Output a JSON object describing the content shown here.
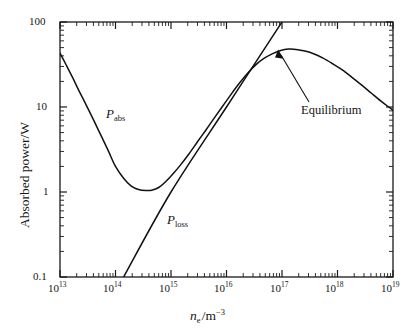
{
  "chart_data": {
    "type": "line",
    "title": "",
    "xlabel": "n_e /m^-3",
    "ylabel": "Absorbed power/W",
    "xscale": "log",
    "yscale": "log",
    "xlim": [
      10000000000000.0,
      1e+19
    ],
    "ylim": [
      0.1,
      100
    ],
    "grid": false,
    "legend_position": "inline-curve-labels",
    "x_tick_labels": [
      "10^13",
      "10^14",
      "10^15",
      "10^16",
      "10^17",
      "10^18",
      "10^19"
    ],
    "x_tick_values": [
      10000000000000.0,
      100000000000000.0,
      1000000000000000.0,
      1e+16,
      1e+17,
      1e+18,
      1e+19
    ],
    "y_tick_labels": [
      "100",
      "10",
      "1",
      "0.1"
    ],
    "y_tick_values": [
      100,
      10,
      1,
      0.1
    ],
    "series": [
      {
        "name": "P_abs",
        "label_mantissa": "P",
        "label_subscript": "abs",
        "description": "Absorbed power; falls from 43 W at 1e13 to a minimum of about 1.05 W near 4.5e14, then rises to a broad maximum of about 48 W near 1.2e17 and decreases to about 9 W at 1e19",
        "points": [
          [
            10000000000000.0,
            43.0
          ],
          [
            13000000000000.0,
            31.0
          ],
          [
            17000000000000.0,
            22.0
          ],
          [
            22000000000000.0,
            15.5
          ],
          [
            30000000000000.0,
            10.4
          ],
          [
            40000000000000.0,
            7.1
          ],
          [
            55000000000000.0,
            4.6
          ],
          [
            75000000000000.0,
            3.0
          ],
          [
            100000000000000.0,
            2.0
          ],
          [
            140000000000000.0,
            1.45
          ],
          [
            190000000000000.0,
            1.18
          ],
          [
            260000000000000.0,
            1.07
          ],
          [
            350000000000000.0,
            1.04
          ],
          [
            450000000000000.0,
            1.05
          ],
          [
            600000000000000.0,
            1.13
          ],
          [
            800000000000000.0,
            1.32
          ],
          [
            1100000000000000.0,
            1.65
          ],
          [
            1500000000000000.0,
            2.1
          ],
          [
            2100000000000000.0,
            2.8
          ],
          [
            3000000000000000.0,
            3.9
          ],
          [
            4200000000000000.0,
            5.3
          ],
          [
            6000000000000000.0,
            7.4
          ],
          [
            8500000000000000.0,
            10.2
          ],
          [
            1.2e+16,
            14.0
          ],
          [
            1.7e+16,
            19.0
          ],
          [
            2.4e+16,
            25.0
          ],
          [
            3.4e+16,
            31.5
          ],
          [
            4.8e+16,
            37.5
          ],
          [
            6.8e+16,
            42.5
          ],
          [
            9.5e+16,
            46.3
          ],
          [
            1.3e+17,
            48.0
          ],
          [
            1.8e+17,
            47.6
          ],
          [
            2.6e+17,
            45.5
          ],
          [
            3.8e+17,
            42.0
          ],
          [
            5.5e+17,
            37.5
          ],
          [
            8e+17,
            32.5
          ],
          [
            1.2e+18,
            27.5
          ],
          [
            1.8e+18,
            22.5
          ],
          [
            2.7e+18,
            18.2
          ],
          [
            4e+18,
            14.7
          ],
          [
            6e+18,
            11.8
          ],
          [
            8e+18,
            10.2
          ],
          [
            1e+19,
            9.2
          ]
        ]
      },
      {
        "name": "P_loss",
        "label_mantissa": "P",
        "label_subscript": "loss",
        "description": "Loss power; straight line on the log-log axes, passing 0.1 W at about 1.4e14 and rising steeply off the top of the plot near 1.1e17",
        "points": [
          [
            140000000000000.0,
            0.1
          ],
          [
            1000000000000000.0,
            1.0
          ],
          [
            1e+16,
            10.0
          ],
          [
            7e+16,
            70.0
          ],
          [
            1.05e+17,
            105.0
          ]
        ]
      }
    ],
    "annotations": [
      {
        "name": "equilibrium",
        "text": "Equilibrium",
        "points_to_x": 7e+16,
        "points_to_y": 41.0,
        "description": "Arrow marking where P_abs and P_loss curves intersect"
      }
    ]
  }
}
